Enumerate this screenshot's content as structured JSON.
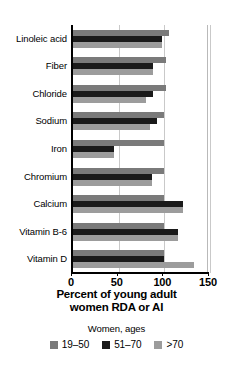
{
  "chart_data": {
    "type": "bar",
    "orientation": "horizontal",
    "title": "",
    "xlabel": "Percent of young adult women RDA or AI",
    "xlabel_line1": "Percent of young adult",
    "xlabel_line2": "women RDA or AI",
    "ylabel": "",
    "xlim": [
      0,
      150
    ],
    "xticks": [
      0,
      50,
      100,
      150
    ],
    "xtick_labels": [
      "0",
      "50",
      "100",
      "150"
    ],
    "grid": true,
    "grid_axis": "x",
    "legend_position": "bottom",
    "legend_title": "Women, ages",
    "categories": [
      "Linoleic acid",
      "Fiber",
      "Chloride",
      "Sodium",
      "Iron",
      "Chromium",
      "Calcium",
      "Vitamin B-6",
      "Vitamin D"
    ],
    "series": [
      {
        "name": "19–50",
        "color": "#7a7a7a",
        "values": [
          105,
          102,
          102,
          100,
          100,
          100,
          100,
          100,
          100
        ]
      },
      {
        "name": "51–70",
        "color": "#1a1a1a",
        "values": [
          97,
          88,
          88,
          92,
          45,
          86,
          120,
          115,
          100
        ]
      },
      {
        "name": ">70",
        "color": "#9c9c9c",
        "values": [
          97,
          88,
          80,
          84,
          45,
          86,
          120,
          115,
          133
        ]
      }
    ]
  },
  "legend": {
    "title": "Women, ages",
    "items": [
      {
        "label": "19–50",
        "color": "#7a7a7a"
      },
      {
        "label": "51–70",
        "color": "#1a1a1a"
      },
      {
        "label": ">70",
        "color": "#9c9c9c"
      }
    ]
  },
  "colors": {
    "series_19_50": "#7a7a7a",
    "series_51_70": "#1a1a1a",
    "series_over_70": "#9c9c9c",
    "axis": "#000000",
    "grid": "#c9c9c9",
    "background": "#ffffff"
  }
}
